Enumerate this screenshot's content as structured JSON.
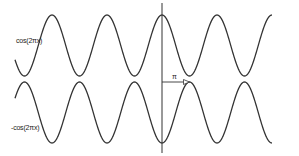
{
  "diagram": {
    "waves": [
      {
        "name": "top",
        "label": "cos(2πx)",
        "center_y": 45.5,
        "amplitude": 30.5,
        "sign": 1
      },
      {
        "name": "bottom",
        "label": "-cos(2πx)",
        "center_y": 112.5,
        "amplitude": 30.5,
        "sign": -1
      }
    ],
    "x_start": 15,
    "x_end": 272,
    "period_px": 55,
    "phase_origin_x": 162,
    "vertical_line": {
      "x": 162,
      "y1": 3,
      "y2": 153
    },
    "arrow": {
      "label": "π",
      "x1": 162,
      "x2": 189.5,
      "y": 82
    },
    "stroke_color": "#333333"
  }
}
